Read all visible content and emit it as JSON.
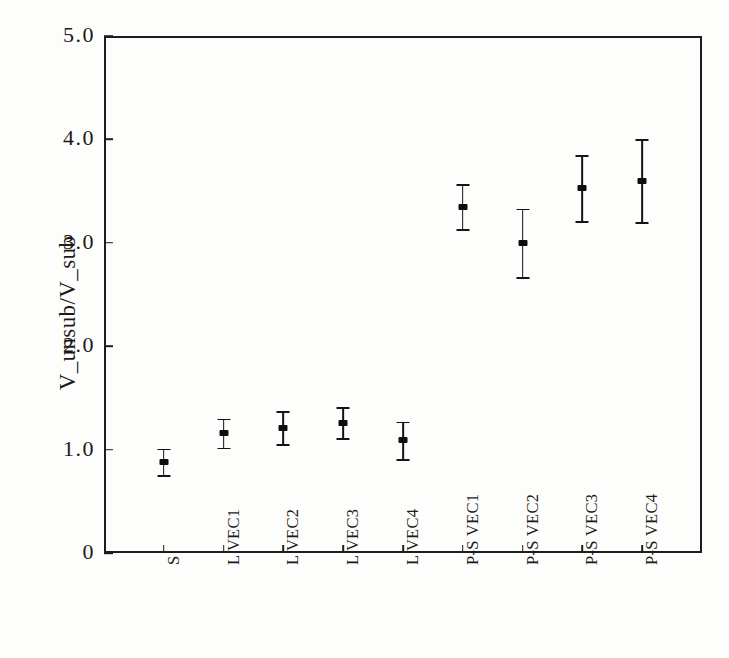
{
  "chart_data": {
    "type": "scatter",
    "title": "",
    "subtitle": "",
    "xlabel": "",
    "ylabel": "V_unsub/V_sub",
    "categories": [
      "S",
      "L VEC1",
      "L VEC2",
      "L VEC3",
      "L VEC4",
      "P-S VEC1",
      "P-S VEC2",
      "P-S VEC3",
      "P-S VEC4"
    ],
    "values": [
      0.88,
      1.16,
      1.21,
      1.26,
      1.09,
      3.35,
      3.0,
      3.53,
      3.6
    ],
    "errors": [
      0.13,
      0.14,
      0.16,
      0.15,
      0.18,
      0.22,
      0.33,
      0.32,
      0.4
    ],
    "ylim": [
      0,
      5
    ],
    "yticks": [
      0,
      1,
      2,
      3,
      4,
      5
    ],
    "ytick_labels": [
      "0",
      "1.0",
      "2.0",
      "3.0",
      "4.0",
      "5.0"
    ],
    "grid": false,
    "legend": null,
    "marker_style": "filled-square-with-error-bars",
    "series": [
      {
        "name": "V_unsub/V_sub",
        "points": [
          {
            "category": "S",
            "value": 0.88,
            "error": 0.13
          },
          {
            "category": "L VEC1",
            "value": 1.16,
            "error": 0.14
          },
          {
            "category": "L VEC2",
            "value": 1.21,
            "error": 0.16
          },
          {
            "category": "L VEC3",
            "value": 1.26,
            "error": 0.15
          },
          {
            "category": "L VEC4",
            "value": 1.09,
            "error": 0.18
          },
          {
            "category": "P-S VEC1",
            "value": 3.35,
            "error": 0.22
          },
          {
            "category": "P-S VEC2",
            "value": 3.0,
            "error": 0.33
          },
          {
            "category": "P-S VEC3",
            "value": 3.53,
            "error": 0.32
          },
          {
            "category": "P-S VEC4",
            "value": 3.6,
            "error": 0.4
          }
        ]
      }
    ]
  },
  "colors": {
    "ink": "#1a1a1a",
    "axis": "#1d1d1d",
    "background": "#fdfdfc"
  }
}
